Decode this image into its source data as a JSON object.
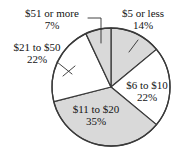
{
  "chart_data": {
    "type": "pie",
    "title": "",
    "subtitle": "",
    "xlabel": "",
    "ylabel": "",
    "legend": "none",
    "grid": false,
    "start_angle_deg": 0,
    "direction": "clockwise",
    "categories": [
      "$5 or less",
      "$6 to $10",
      "$11 to $20",
      "$21 to $50",
      "$51 or more"
    ],
    "values": [
      14,
      22,
      35,
      22,
      7
    ],
    "value_unit": "%",
    "slices": [
      {
        "label": "$5 or less",
        "percent_text": "14%",
        "value": 14,
        "fill": "#d9d9d9",
        "label_placement": "outside",
        "leader_line": true
      },
      {
        "label": "$6 to $10",
        "percent_text": "22%",
        "value": 22,
        "fill": "#ffffff",
        "label_placement": "inside",
        "leader_line": false
      },
      {
        "label": "$11 to $20",
        "percent_text": "35%",
        "value": 35,
        "fill": "#d9d9d9",
        "label_placement": "inside",
        "leader_line": false
      },
      {
        "label": "$21 to $50",
        "percent_text": "22%",
        "value": 22,
        "fill": "#ffffff",
        "label_placement": "outside",
        "leader_line": true
      },
      {
        "label": "$51 or more",
        "percent_text": "7%",
        "value": 7,
        "fill": "#d9d9d9",
        "label_placement": "outside",
        "leader_line": true
      }
    ],
    "colors": {
      "shaded_slice": "#d9d9d9",
      "unshaded_slice": "#ffffff",
      "outline": "#3a3a3a",
      "text": "#141414",
      "background": "#ffffff"
    }
  }
}
